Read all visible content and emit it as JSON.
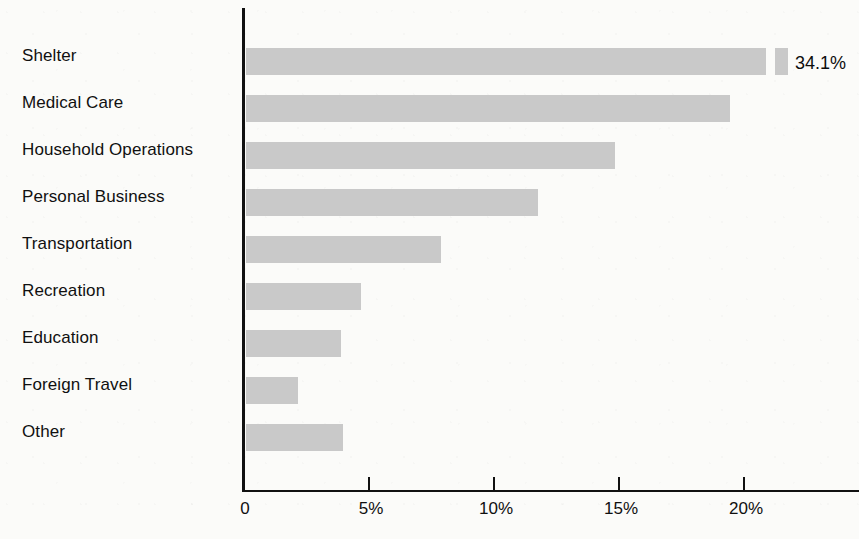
{
  "chart_data": {
    "type": "bar",
    "orientation": "horizontal",
    "title": "",
    "subtitle": "",
    "xlabel": "",
    "ylabel": "",
    "xlim": [
      0,
      24.7
    ],
    "grid": false,
    "legend": null,
    "axis_tick_labels": [
      "0",
      "5%",
      "10%",
      "15%",
      "20%"
    ],
    "axis_tick_values": [
      0,
      5,
      10,
      15,
      20
    ],
    "has_broken_bar": true,
    "broken_bar_category": "Shelter",
    "categories": [
      "Shelter",
      "Medical Care",
      "Household Operations",
      "Personal Business",
      "Transportation",
      "Recreation",
      "Education",
      "Foreign Travel",
      "Other"
    ],
    "values": [
      34.1,
      19.4,
      14.8,
      11.7,
      7.8,
      4.6,
      3.8,
      2.1,
      3.9
    ],
    "data_labels": [
      "34.1%",
      "",
      "",
      "",
      "",
      "",
      "",
      "",
      ""
    ],
    "bar_color": "#c9c9c9",
    "axis_color": "#111111",
    "text_color": "#101010",
    "background_color": "#fbfbf9"
  }
}
